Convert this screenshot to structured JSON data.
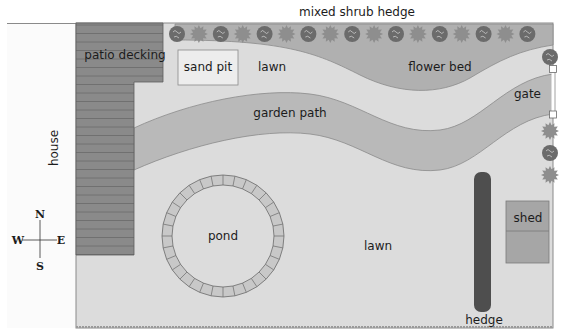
{
  "title": "mixed shrub hedge",
  "labels": {
    "house": "house",
    "patio": "patio decking",
    "sandpit": "sand pit",
    "lawn_top": "lawn",
    "flowerbed": "flower bed",
    "gate": "gate",
    "path": "garden path",
    "pond": "pond",
    "lawn_bottom": "lawn",
    "shed": "shed",
    "hedge": "hedge"
  },
  "compass": {
    "n": "N",
    "s": "S",
    "e": "E",
    "w": "W"
  },
  "colors": {
    "lawn": "#dcdcdc",
    "house": "#fbfbfb",
    "decking": "#8a8a8a",
    "path": "#b9b9b9",
    "flowerbed": "#b0b0b0",
    "sandpit": "#ededed",
    "hedge": "#4e4e4e",
    "shed": "#a6a6a6",
    "shrub_dark": "#6b6b6b",
    "shrub_light": "#8e8e8e"
  }
}
